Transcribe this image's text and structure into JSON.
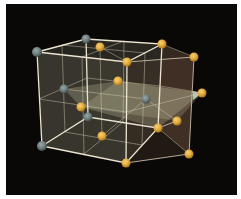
{
  "diagram": {
    "title": "",
    "colors": {
      "background": "#0a0806",
      "border": "#ffffff",
      "edge": "#e8e0cc",
      "grey_atom": "#6d7c7c",
      "gold_atom": "#e0a83a",
      "plane": "#c8c8a0",
      "plane_dark": "#5a4a3a",
      "highlight": "#c8e0c8"
    },
    "atoms": {
      "grey": [
        {
          "x": 37,
          "y": 52
        },
        {
          "x": 86,
          "y": 39
        },
        {
          "x": 64,
          "y": 89
        },
        {
          "x": 88,
          "y": 117
        },
        {
          "x": 42,
          "y": 146
        },
        {
          "x": 146,
          "y": 99
        }
      ],
      "gold": [
        {
          "x": 100,
          "y": 47
        },
        {
          "x": 162,
          "y": 44
        },
        {
          "x": 127,
          "y": 62
        },
        {
          "x": 118,
          "y": 81
        },
        {
          "x": 81,
          "y": 107
        },
        {
          "x": 194,
          "y": 57
        },
        {
          "x": 202,
          "y": 93
        },
        {
          "x": 158,
          "y": 128
        },
        {
          "x": 177,
          "y": 121
        },
        {
          "x": 102,
          "y": 136
        },
        {
          "x": 126,
          "y": 163
        },
        {
          "x": 189,
          "y": 154
        }
      ]
    }
  }
}
